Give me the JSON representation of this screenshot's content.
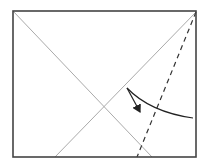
{
  "diagram": {
    "type": "origami-fold-step",
    "square": {
      "x1": 13,
      "y1": 11,
      "x2": 196,
      "y2": 157,
      "stroke": "#444444"
    },
    "crease_lines": [
      {
        "name": "diagonal-left",
        "x1": 13,
        "y1": 11,
        "x2": 152,
        "y2": 157,
        "stroke": "#aaaaaa"
      },
      {
        "name": "diagonal-right",
        "x1": 196,
        "y1": 12,
        "x2": 55,
        "y2": 157,
        "stroke": "#aaaaaa"
      }
    ],
    "fold_line": {
      "style": "valley-dashed",
      "x1": 196,
      "y1": 12,
      "x2": 137,
      "y2": 157,
      "stroke": "#333333"
    },
    "fold_arrow": {
      "from": [
        193,
        118
      ],
      "via": [
        127,
        88
      ],
      "to": [
        141,
        113
      ],
      "stroke": "#222222"
    }
  }
}
